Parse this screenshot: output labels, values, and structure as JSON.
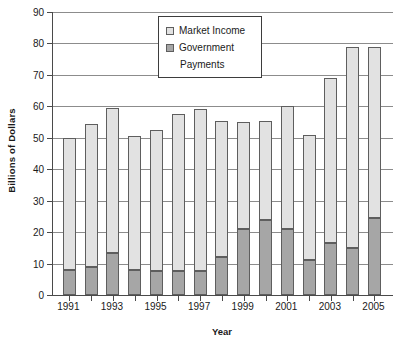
{
  "chart_data": {
    "type": "bar",
    "stacked": true,
    "title": "",
    "xlabel": "Year",
    "ylabel": "Billions of Dollars",
    "ylim": [
      0,
      90
    ],
    "ytick_step": 10,
    "yticks": [
      0,
      10,
      20,
      30,
      40,
      50,
      60,
      70,
      80,
      90
    ],
    "grid": true,
    "categories": [
      1991,
      1992,
      1993,
      1994,
      1995,
      1996,
      1997,
      1998,
      1999,
      2000,
      2001,
      2002,
      2003,
      2004,
      2005
    ],
    "xtick_labels": [
      "1991",
      "",
      "1993",
      "",
      "1995",
      "",
      "1997",
      "",
      "1999",
      "",
      "2001",
      "",
      "2003",
      "",
      "2005"
    ],
    "legend_position": "top-center",
    "series": [
      {
        "name": "Government Payments",
        "color": "#a6a6a6",
        "values": [
          8,
          9,
          13.5,
          8,
          7.5,
          7.5,
          7.5,
          12,
          21,
          24,
          21,
          11,
          16.5,
          15,
          24.5
        ]
      },
      {
        "name": "Market Income",
        "color": "#e2e2e2",
        "values": [
          42,
          45.5,
          46,
          42.5,
          45,
          50,
          51.5,
          43.5,
          34,
          31.5,
          39,
          40,
          52.5,
          64,
          54.5
        ]
      }
    ],
    "totals": [
      50,
      54.5,
      59.5,
      50.5,
      52.5,
      57.5,
      59,
      55.5,
      55,
      55.5,
      60,
      51,
      69,
      79,
      79
    ]
  },
  "legend": {
    "entries": [
      {
        "label": "Market Income",
        "swatch": "market"
      },
      {
        "label": "Government",
        "swatch": "gov"
      }
    ],
    "continuation_label": "Payments"
  }
}
